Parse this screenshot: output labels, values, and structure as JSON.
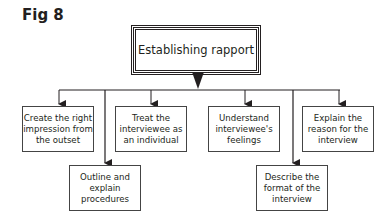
{
  "figure_label": "Fig 8",
  "root": {
    "label": "Establishing rapport"
  },
  "top_row": [
    {
      "label": "Create the right impression from the outset"
    },
    {
      "label": "Treat the interviewee as an individual"
    },
    {
      "label": "Understand interviewee's feelings"
    },
    {
      "label": "Explain the reason for the interview"
    }
  ],
  "bottom_row": [
    {
      "label": "Outline and explain procedures"
    },
    {
      "label": "Describe the format of the interview"
    }
  ],
  "colors": {
    "stroke": "#231f20",
    "background": "#ffffff"
  }
}
